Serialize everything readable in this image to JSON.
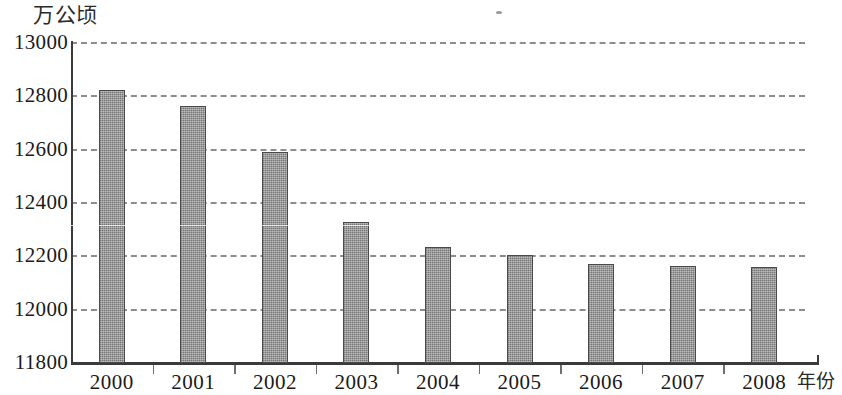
{
  "chart_data": {
    "type": "bar",
    "title": "",
    "subtitle": "",
    "xlabel": "年份",
    "ylabel": "万公顷",
    "categories": [
      "2000",
      "2001",
      "2002",
      "2003",
      "2004",
      "2005",
      "2006",
      "2007",
      "2008"
    ],
    "values": [
      12824,
      12762,
      12593,
      12330,
      12235,
      12205,
      12172,
      12165,
      12160
    ],
    "series": [
      {
        "name": "耕地面积",
        "values": [
          12824,
          12762,
          12593,
          12330,
          12235,
          12205,
          12172,
          12165,
          12160
        ]
      }
    ],
    "ylim": [
      11800,
      13000
    ],
    "yticks": [
      11800,
      12000,
      12200,
      12400,
      12600,
      12800,
      13000
    ],
    "ytick_labels": [
      "11800",
      "12000",
      "12200",
      "12400",
      "12600",
      "12800",
      "13000"
    ],
    "grid": true,
    "grid_axis": "y",
    "grid_style": "dashed",
    "legend": false,
    "legend_position": "none",
    "bar_color": "#8e8e8e",
    "bar_border_color": "#4a4a4a",
    "axis_color": "#3a3a3a",
    "grid_color": "#8d8d8d",
    "background_color": "#ffffff"
  },
  "axes": {
    "y_unit_label": "万公顷",
    "x_unit_label": "年份"
  }
}
